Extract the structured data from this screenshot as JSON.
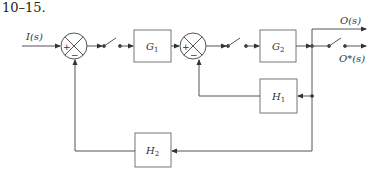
{
  "title": "10–15.",
  "signals": {
    "input": "I(s)",
    "output": "O(s)",
    "sampled_output": "O*(s)"
  },
  "blocks": {
    "g1": {
      "name": "G",
      "sub": "1"
    },
    "g2": {
      "name": "G",
      "sub": "2"
    },
    "h1": {
      "name": "H",
      "sub": "1"
    },
    "h2": {
      "name": "H",
      "sub": "2"
    }
  },
  "junctions": {
    "sum1": {
      "plus": "+",
      "minus": "−"
    },
    "sum2": {
      "plus": "+",
      "minus": "−"
    }
  },
  "colors": {
    "line": "#555555",
    "block_border": "#777777"
  }
}
